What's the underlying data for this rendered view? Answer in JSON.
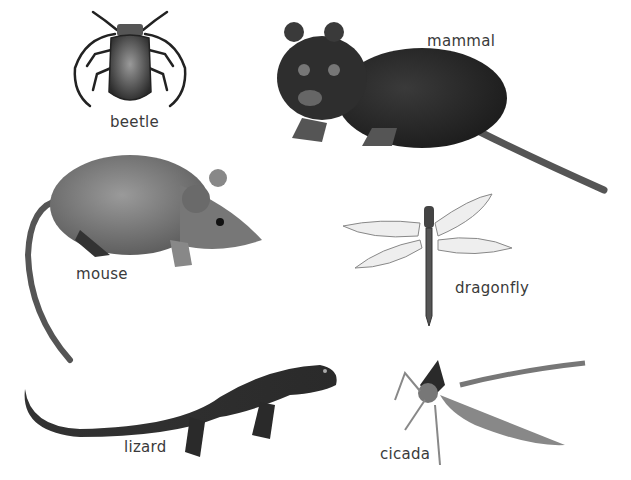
{
  "figure": {
    "background": "#ffffff",
    "animals": [
      {
        "id": "beetle",
        "label": "beetle"
      },
      {
        "id": "mammal",
        "label": "mammal"
      },
      {
        "id": "mouse",
        "label": "mouse"
      },
      {
        "id": "dragonfly",
        "label": "dragonfly"
      },
      {
        "id": "lizard",
        "label": "lizard"
      },
      {
        "id": "cicada",
        "label": "cicada"
      }
    ]
  }
}
